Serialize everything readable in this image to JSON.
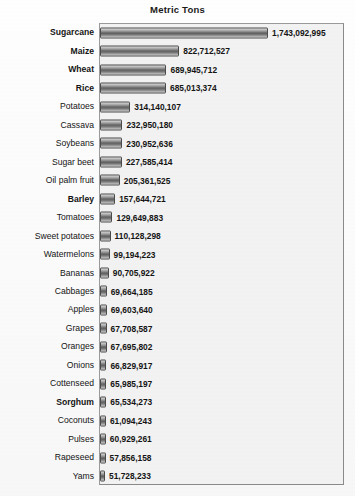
{
  "chart_data": {
    "type": "bar",
    "orientation": "horizontal",
    "title": "Metric Tons",
    "xlabel": "",
    "ylabel": "",
    "grid": false,
    "legend": null,
    "xlim": [
      0,
      1743092995
    ],
    "categories": [
      "Sugarcane",
      "Maize",
      "Wheat",
      "Rice",
      "Potatoes",
      "Cassava",
      "Soybeans",
      "Sugar beet",
      "Oil palm fruit",
      "Barley",
      "Tomatoes",
      "Sweet potatoes",
      "Watermelons",
      "Bananas",
      "Cabbages",
      "Apples",
      "Grapes",
      "Oranges",
      "Onions",
      "Cottenseed",
      "Sorghum",
      "Coconuts",
      "Pulses",
      "Rapeseed",
      "Yams"
    ],
    "values": [
      1743092995,
      822712527,
      689945712,
      685013374,
      314140107,
      232950180,
      230952636,
      227585414,
      205361525,
      157644721,
      129649883,
      110128298,
      99194223,
      90705922,
      69664185,
      69603640,
      67708587,
      67695802,
      66829917,
      65985197,
      65534273,
      61094243,
      60929261,
      57856158,
      51728233
    ],
    "value_labels": [
      "1,743,092,995",
      "822,712,527",
      "689,945,712",
      "685,013,374",
      "314,140,107",
      "232,950,180",
      "230,952,636",
      "227,585,414",
      "205,361,525",
      "157,644,721",
      "129,649,883",
      "110,128,298",
      "99,194,223",
      "90,705,922",
      "69,664,185",
      "69,603,640",
      "67,708,587",
      "67,695,802",
      "66,829,917",
      "65,985,197",
      "65,534,273",
      "61,094,243",
      "60,929,261",
      "57,856,158",
      "51,728,233"
    ],
    "emphasized_categories": [
      "Sugarcane",
      "Maize",
      "Wheat",
      "Rice",
      "Barley",
      "Sorghum"
    ],
    "colors": {
      "bar_fill_dark": "#5c5c5c",
      "bar_fill_light": "#d8d8d8",
      "bar_border": "#4a4a4a",
      "plot_background": "#f2f2f2",
      "plot_border": "#8a8a8a",
      "text": "#141414"
    }
  }
}
